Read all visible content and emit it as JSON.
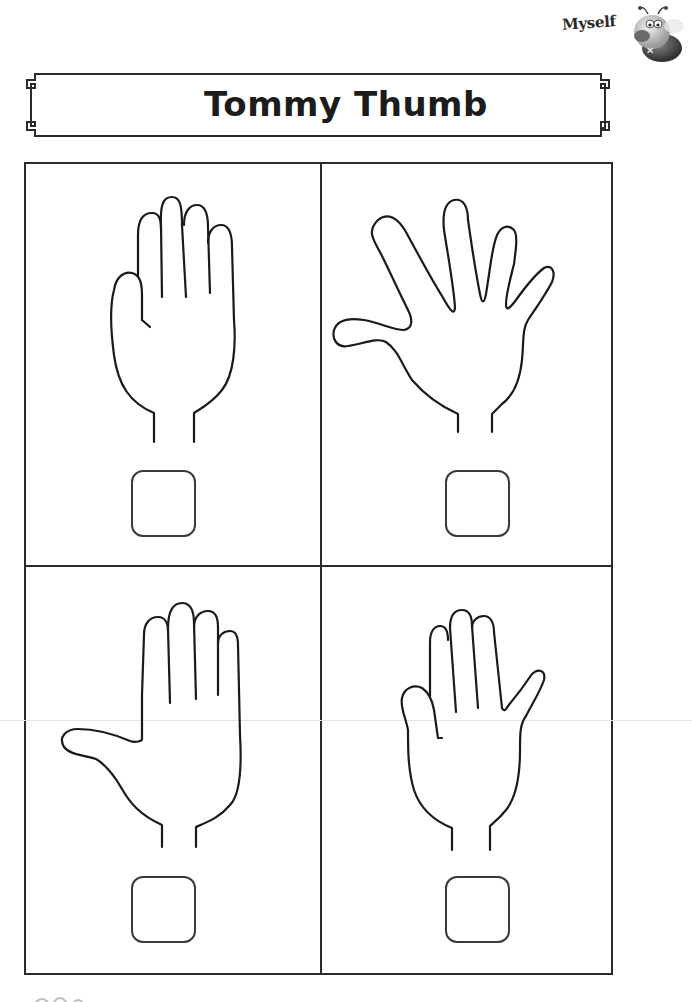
{
  "header": {
    "topic_label": "Myself",
    "mascot_icon": "bee-mascot-icon"
  },
  "title": {
    "text": "Tommy Thumb"
  },
  "panels": [
    {
      "position": "top-left",
      "hand_pose": "all-fingers-up-thumb-tucked",
      "answer_box": ""
    },
    {
      "position": "top-right",
      "hand_pose": "fingers-spread-open",
      "answer_box": ""
    },
    {
      "position": "bottom-left",
      "hand_pose": "thumb-out-fingers-together",
      "answer_box": ""
    },
    {
      "position": "bottom-right",
      "hand_pose": "little-finger-out",
      "answer_box": ""
    }
  ],
  "colors": {
    "ink": "#1a1a1a",
    "border": "#2b2b2b",
    "background": "#ffffff"
  }
}
